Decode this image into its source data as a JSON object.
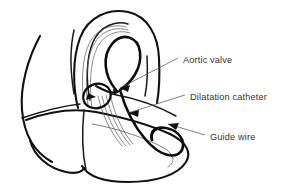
{
  "figure": {
    "background_color": "#ffffff",
    "line_color": "#111111",
    "text_color": "#333333",
    "thin_line_color": "#5a5a5a"
  },
  "labels": {
    "aortic_valve": "Aortic valve",
    "dilatation_catheter": "Dilatation catheter",
    "guide_wire": "Guide wire"
  },
  "structures": {
    "aortic_arch": "aortic-arch-outline",
    "ascending_aorta": "ascending-aorta-outline",
    "descending_aorta": "descending-aorta-outline",
    "left_atrium": "left-atrium-outline",
    "left_ventricle": "left-ventricle-outline",
    "ventricle_apex": "ventricle-apex-outline",
    "aortic_valve": "aortic-valve-ellipse",
    "catheter": "dilatation-catheter-lines",
    "guide_wire_loop": "guide-wire-arch-loop",
    "guide_wire_curl": "guide-wire-ventricle-curl"
  }
}
